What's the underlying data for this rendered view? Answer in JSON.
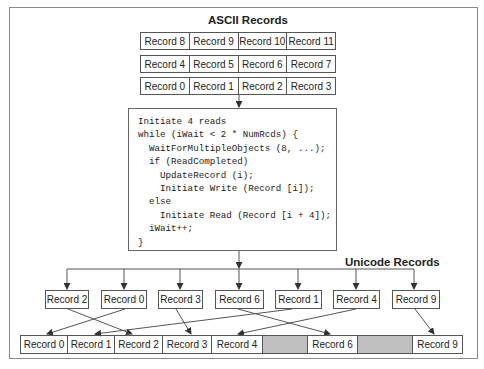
{
  "ascii": {
    "title": "ASCII Records",
    "rows": [
      [
        "Record 8",
        "Record 9",
        "Record 10",
        "Record 11"
      ],
      [
        "Record 4",
        "Record 5",
        "Record 6",
        "Record 7"
      ],
      [
        "Record 0",
        "Record 1",
        "Record 2",
        "Record 3"
      ]
    ]
  },
  "code": {
    "lines": [
      "Initiate 4 reads",
      "while (iWait < 2 * NumRcds) {",
      "  WaitForMultipleObjects (8, ...);",
      "  if (ReadCompleted)",
      "    UpdateRecord (i);",
      "    Initiate Write (Record [i]);",
      "  else",
      "    Initiate Read (Record [i + 4]);",
      "  iWait++;",
      "}"
    ]
  },
  "unicode": {
    "title": "Unicode Records",
    "buffers": [
      "Record 2",
      "Record 0",
      "Record 3",
      "Record 6",
      "Record 1",
      "Record 4",
      "Record 9"
    ],
    "output": [
      "Record 0",
      "Record 1",
      "Record 2",
      "Record 3",
      "Record 4",
      "",
      "Record 6",
      "",
      "Record 9"
    ]
  },
  "colors": {
    "border": "#555555",
    "frame": "#8a8a8a",
    "empty_fill": "#c0c0c0"
  }
}
